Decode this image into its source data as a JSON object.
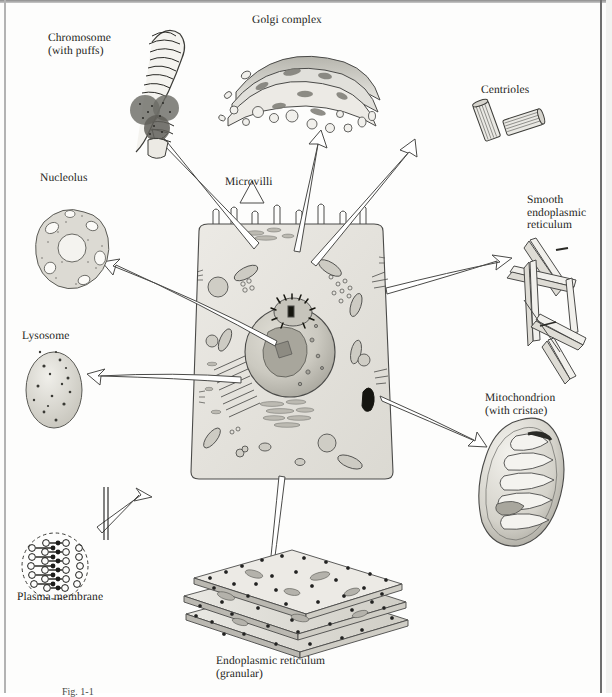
{
  "figure": {
    "type": "biology-illustration",
    "caption_partial": "Fig. 1-1"
  },
  "labels": {
    "chromosome": "Chromosome\n(with puffs)",
    "golgi": "Golgi complex",
    "centrioles": "Centrioles",
    "nucleolus": "Nucleolus",
    "microvilli": "Microvilli",
    "smooth_er": "Smooth\nendoplasmic\nreticulum",
    "lysosome": "Lysosome",
    "mitochondrion": "Mitochondrion\n(with cristae)",
    "plasma_membrane": "Plasma membrane",
    "granular_er": "Endoplasmic reticulum\n(granular)"
  },
  "colors": {
    "ink": "#1d1d1b",
    "line": "#4a4a48",
    "cytoplasm": "#e4e3de",
    "nucleus": "#c9c7bf",
    "organelle_fill": "#d8d6cf",
    "golgi_dark": "#9a9992",
    "paper": "#fdfdfc"
  },
  "organelles": [
    {
      "name": "chromosome",
      "position": "top-left"
    },
    {
      "name": "golgi-complex",
      "position": "top-center"
    },
    {
      "name": "centrioles",
      "position": "top-right"
    },
    {
      "name": "nucleolus",
      "position": "left-upper"
    },
    {
      "name": "microvilli",
      "position": "center-top"
    },
    {
      "name": "smooth-endoplasmic-reticulum",
      "position": "right-upper"
    },
    {
      "name": "lysosome",
      "position": "left-lower"
    },
    {
      "name": "mitochondrion",
      "position": "right-lower"
    },
    {
      "name": "plasma-membrane",
      "position": "bottom-left"
    },
    {
      "name": "granular-endoplasmic-reticulum",
      "position": "bottom-center"
    }
  ]
}
